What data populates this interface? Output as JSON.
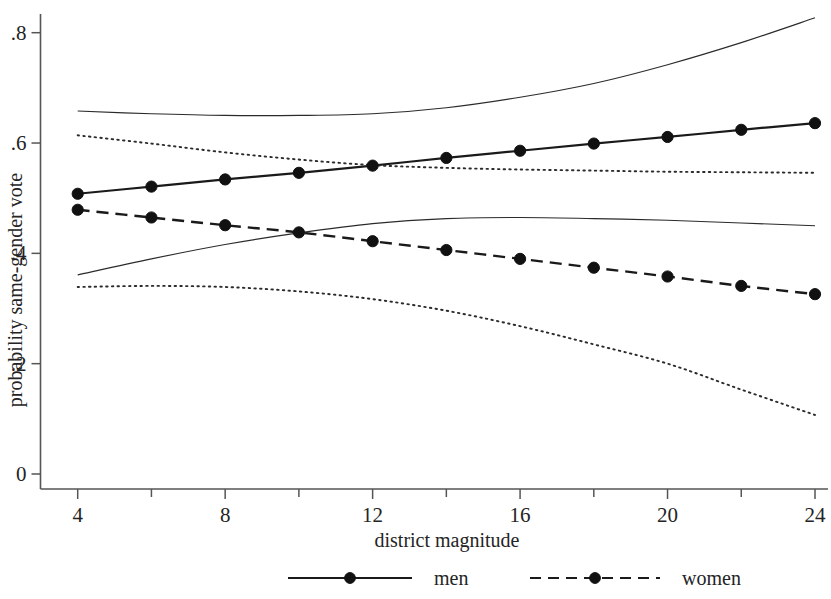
{
  "chart_data": {
    "type": "line",
    "title": "",
    "xlabel": "district magnitude",
    "ylabel": "probability same-gender vote",
    "xlim": [
      3.2,
      24.8
    ],
    "ylim": [
      0,
      0.855
    ],
    "xticks": [
      4,
      8,
      12,
      16,
      20,
      24
    ],
    "xtick_labels": [
      "4",
      "8",
      "12",
      "16",
      "20",
      "24"
    ],
    "xminorticks": [
      6,
      10,
      14,
      18,
      22
    ],
    "yticks": [
      0,
      0.2,
      0.4,
      0.6,
      0.8
    ],
    "ytick_labels": [
      "0",
      ".2",
      ".4",
      ".6",
      ".8"
    ],
    "grid": false,
    "legend_position": "bottom",
    "x": [
      4,
      6,
      8,
      10,
      12,
      14,
      16,
      18,
      20,
      22,
      24
    ],
    "series": [
      {
        "name": "men",
        "style": "solid-with-markers",
        "markers": true,
        "values": [
          0.508,
          0.521,
          0.534,
          0.546,
          0.559,
          0.573,
          0.586,
          0.599,
          0.611,
          0.624,
          0.636
        ]
      },
      {
        "name": "women",
        "style": "dashed-with-markers",
        "markers": true,
        "values": [
          0.479,
          0.465,
          0.451,
          0.438,
          0.422,
          0.406,
          0.39,
          0.374,
          0.358,
          0.341,
          0.326
        ]
      },
      {
        "name": "men-ci-upper",
        "style": "solid",
        "markers": false,
        "x": [
          4,
          6,
          8,
          10,
          12,
          14,
          16,
          18,
          20,
          22,
          24
        ],
        "values": [
          0.658,
          0.653,
          0.65,
          0.65,
          0.653,
          0.664,
          0.683,
          0.708,
          0.742,
          0.782,
          0.827
        ]
      },
      {
        "name": "men-ci-lower",
        "style": "solid",
        "markers": false,
        "x": [
          4,
          6,
          8,
          10,
          12,
          14,
          16,
          18,
          20,
          22,
          24
        ],
        "values": [
          0.361,
          0.39,
          0.416,
          0.437,
          0.454,
          0.463,
          0.465,
          0.463,
          0.46,
          0.455,
          0.45
        ]
      },
      {
        "name": "women-ci-upper",
        "style": "dotted",
        "markers": false,
        "x": [
          4,
          6,
          8,
          10,
          12,
          14,
          16,
          18,
          20,
          22,
          24
        ],
        "values": [
          0.614,
          0.599,
          0.583,
          0.57,
          0.56,
          0.555,
          0.552,
          0.55,
          0.548,
          0.547,
          0.546
        ]
      },
      {
        "name": "women-ci-lower",
        "style": "dotted",
        "markers": false,
        "x": [
          4,
          6,
          8,
          10,
          12,
          14,
          16,
          18,
          20,
          22,
          24
        ],
        "values": [
          0.339,
          0.341,
          0.339,
          0.331,
          0.317,
          0.296,
          0.268,
          0.235,
          0.2,
          0.153,
          0.107
        ]
      }
    ],
    "legend": [
      {
        "label": "men",
        "style": "solid-with-marker"
      },
      {
        "label": "women",
        "style": "dashed-with-marker"
      }
    ],
    "colors": {
      "line": "#1a1a1a",
      "axis": "#555555",
      "background": "#ffffff"
    }
  }
}
